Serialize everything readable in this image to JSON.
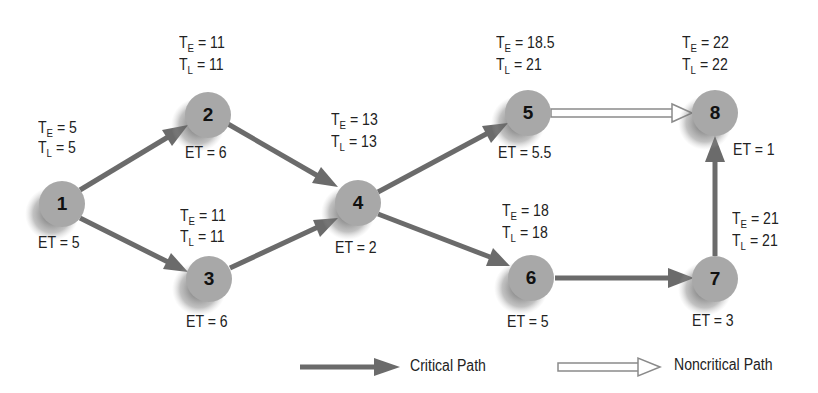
{
  "diagram": {
    "type": "PERT network diagram",
    "colors": {
      "node_fill": "#a8a8a8",
      "node_shadow": "#555555",
      "critical_arrow": "#6b6b6b",
      "noncritical_arrow_outline": "#8a8a8a",
      "text": "#222222"
    },
    "nodes": [
      {
        "id": "1",
        "label": "1",
        "te_label": "T",
        "te_sub": "E",
        "te_value": "= 5",
        "tl_label": "T",
        "tl_sub": "L",
        "tl_value": "= 5",
        "et": "ET = 5"
      },
      {
        "id": "2",
        "label": "2",
        "te_label": "T",
        "te_sub": "E",
        "te_value": "= 11",
        "tl_label": "T",
        "tl_sub": "L",
        "tl_value": "= 11",
        "et": "ET = 6"
      },
      {
        "id": "3",
        "label": "3",
        "te_label": "T",
        "te_sub": "E",
        "te_value": "= 11",
        "tl_label": "T",
        "tl_sub": "L",
        "tl_value": "= 11",
        "et": "ET = 6"
      },
      {
        "id": "4",
        "label": "4",
        "te_label": "T",
        "te_sub": "E",
        "te_value": "= 13",
        "tl_label": "T",
        "tl_sub": "L",
        "tl_value": "= 13",
        "et": "ET = 2"
      },
      {
        "id": "5",
        "label": "5",
        "te_label": "T",
        "te_sub": "E",
        "te_value": "= 18.5",
        "tl_label": "T",
        "tl_sub": "L",
        "tl_value": "= 21",
        "et": "ET = 5.5"
      },
      {
        "id": "6",
        "label": "6",
        "te_label": "T",
        "te_sub": "E",
        "te_value": "= 18",
        "tl_label": "T",
        "tl_sub": "L",
        "tl_value": "= 18",
        "et": "ET = 5"
      },
      {
        "id": "7",
        "label": "7",
        "te_label": "T",
        "te_sub": "E",
        "te_value": "= 21",
        "tl_label": "T",
        "tl_sub": "L",
        "tl_value": "= 21",
        "et": "ET = 3"
      },
      {
        "id": "8",
        "label": "8",
        "te_label": "T",
        "te_sub": "E",
        "te_value": "= 22",
        "tl_label": "T",
        "tl_sub": "L",
        "tl_value": "= 22",
        "et": "ET = 1"
      }
    ],
    "edges": [
      {
        "from": "1",
        "to": "2",
        "type": "critical"
      },
      {
        "from": "1",
        "to": "3",
        "type": "critical"
      },
      {
        "from": "2",
        "to": "4",
        "type": "critical"
      },
      {
        "from": "3",
        "to": "4",
        "type": "critical"
      },
      {
        "from": "4",
        "to": "5",
        "type": "critical"
      },
      {
        "from": "4",
        "to": "6",
        "type": "critical"
      },
      {
        "from": "5",
        "to": "8",
        "type": "noncritical"
      },
      {
        "from": "6",
        "to": "7",
        "type": "critical"
      },
      {
        "from": "7",
        "to": "8",
        "type": "critical"
      }
    ],
    "legend": {
      "critical_label": "Critical Path",
      "noncritical_label": "Noncritical Path"
    }
  }
}
